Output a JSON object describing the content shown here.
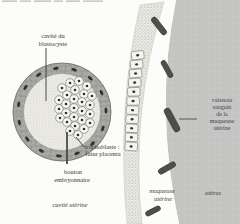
{
  "diagram": {
    "type": "biology-schematic",
    "labels": {
      "cavite_blastocyste_l1": "cavité du",
      "cavite_blastocyste_l2": "blastocyste",
      "trophoblaste_l1": "trophoblaste :",
      "trophoblaste_l2": "futur placenta",
      "bouton_l1": "bouton",
      "bouton_l2": "embryonnaire",
      "cavite_uterine": "cavité utérine",
      "vaisseau_l1": "vaisseau",
      "vaisseau_l2": "sanguin",
      "vaisseau_l3": "de la",
      "vaisseau_l4": "muqueuse",
      "vaisseau_l5": "utérine",
      "muqueuse_l1": "muqueuse",
      "muqueuse_l2": "utérine",
      "uterus": "utérus"
    },
    "colors": {
      "background": "#fcfcf9",
      "uterus_gray": "#c5c5c3",
      "mucosa_white": "#fcfcfa",
      "epithelium_stipple": "#ebebe5",
      "vessel_fill": "#4d5046",
      "trophoblast_ring": "#a6a6a2",
      "label_text": "#3b3b35",
      "vessel_label_text": "#3f4654"
    }
  }
}
